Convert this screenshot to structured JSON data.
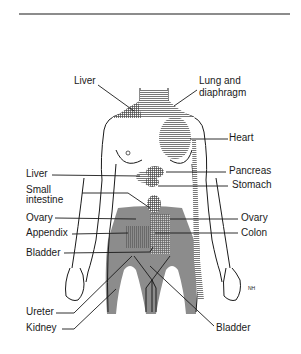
{
  "figure": {
    "signature": "NH",
    "colors": {
      "ink": "#1a1a1a",
      "shade_dark": "#8c8c8c",
      "shade_mid": "#a8a8a8",
      "hatch": "#555555",
      "background": "#ffffff"
    }
  },
  "labels": {
    "left": [
      {
        "id": "liver-top",
        "text": "Liver"
      },
      {
        "id": "liver",
        "text": "Liver"
      },
      {
        "id": "small-intestine-1",
        "text": "Small"
      },
      {
        "id": "small-intestine-2",
        "text": "intestine"
      },
      {
        "id": "ovary-left",
        "text": "Ovary"
      },
      {
        "id": "appendix",
        "text": "Appendix"
      },
      {
        "id": "bladder-left",
        "text": "Bladder"
      },
      {
        "id": "ureter",
        "text": "Ureter"
      },
      {
        "id": "kidney",
        "text": "Kidney"
      }
    ],
    "right": [
      {
        "id": "lung-1",
        "text": "Lung and"
      },
      {
        "id": "lung-2",
        "text": "diaphragm"
      },
      {
        "id": "heart",
        "text": "Heart"
      },
      {
        "id": "pancreas",
        "text": "Pancreas"
      },
      {
        "id": "stomach",
        "text": "Stomach"
      },
      {
        "id": "ovary-right",
        "text": "Ovary"
      },
      {
        "id": "colon",
        "text": "Colon"
      },
      {
        "id": "bladder-right",
        "text": "Bladder"
      }
    ]
  }
}
